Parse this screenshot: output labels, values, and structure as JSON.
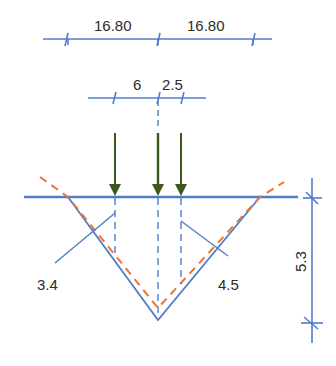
{
  "diagram": {
    "colors": {
      "line": "#4f7ccf",
      "load_arrow": "#3d5a1e",
      "influence_dashed": "#ec7434",
      "text": "#2b2b2b"
    },
    "top_dimension": {
      "labels": [
        "16.80",
        "16.80"
      ]
    },
    "load_dimension": {
      "labels": [
        "6",
        "2.5"
      ]
    },
    "ordinate_labels": {
      "left": "3.4",
      "right": "4.5"
    },
    "height_dimension": {
      "label": "5.3"
    },
    "loads": {
      "count": 3
    }
  }
}
